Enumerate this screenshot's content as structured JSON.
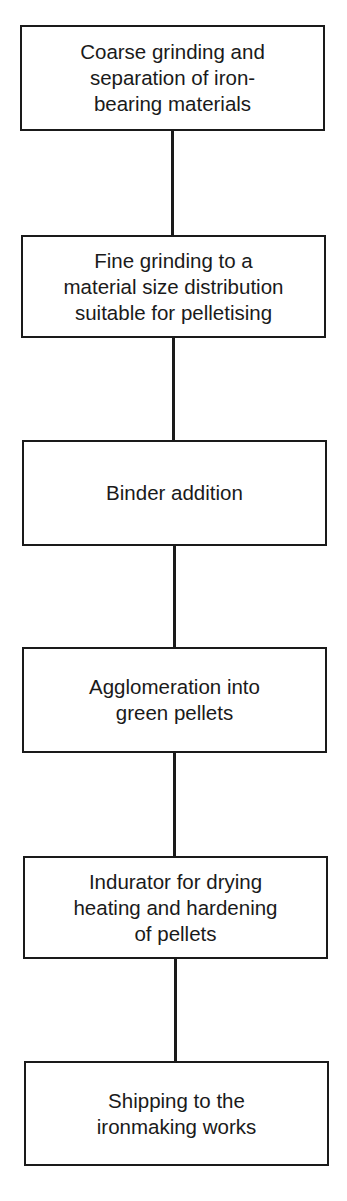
{
  "diagram": {
    "type": "flowchart",
    "direction": "top-to-bottom",
    "steps": [
      {
        "label": "Coarse grinding and\nseparation of iron-\nbearing materials"
      },
      {
        "label": "Fine grinding to a\nmaterial size distribution\nsuitable for pelletising"
      },
      {
        "label": "Binder addition"
      },
      {
        "label": "Agglomeration into\ngreen pellets"
      },
      {
        "label": "Indurator for drying\nheating and hardening\nof pellets"
      },
      {
        "label": "Shipping to the\nironmaking works"
      }
    ]
  },
  "colors": {
    "line": "#1a1a1a",
    "background": "#ffffff"
  }
}
